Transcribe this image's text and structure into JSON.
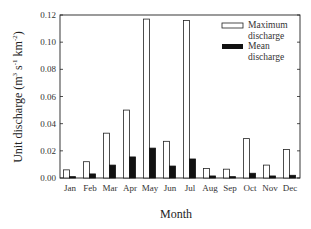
{
  "chart_data": {
    "type": "bar",
    "title": "",
    "xlabel": "Month",
    "ylabel": "Unit discharge (m^3 s^-1 km^-2)",
    "ylabel_parts": {
      "main": "Unit discharge (m",
      "sup1": "3",
      "mid1": " s",
      "sup2": "-1",
      "mid2": " km",
      "sup3": "-2",
      "end": ")"
    },
    "ylim": [
      0,
      0.12
    ],
    "yticks": [
      "0.00",
      "0.02",
      "0.04",
      "0.06",
      "0.08",
      "0.10",
      "0.12"
    ],
    "grid": false,
    "legend_position": "upper right",
    "categories": [
      "Jan",
      "Feb",
      "Mar",
      "Apr",
      "May",
      "Jun",
      "Jul",
      "Aug",
      "Sep",
      "Oct",
      "Nov",
      "Dec"
    ],
    "series": [
      {
        "name": "Maximum discharge",
        "legend_line1": "Maximum",
        "legend_line2": "discharge",
        "fill": "#ffffff",
        "stroke": "#222222",
        "values": [
          0.006,
          0.012,
          0.033,
          0.05,
          0.117,
          0.027,
          0.116,
          0.007,
          0.0065,
          0.029,
          0.0095,
          0.021
        ]
      },
      {
        "name": "Mean discharge",
        "legend_line1": "Mean",
        "legend_line2": "discharge",
        "fill": "#111111",
        "stroke": "#111111",
        "values": [
          0.001,
          0.003,
          0.0095,
          0.0155,
          0.022,
          0.0088,
          0.014,
          0.0015,
          0.001,
          0.0035,
          0.0015,
          0.002
        ]
      }
    ]
  }
}
